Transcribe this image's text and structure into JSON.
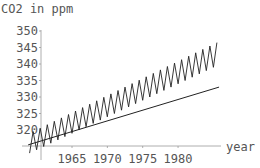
{
  "chart_data": {
    "type": "line",
    "title": "",
    "ylabel": "CO2 in ppm",
    "xlabel": "year",
    "xlim": [
      1958.8,
      1985.8
    ],
    "ylim": [
      314.5,
      350
    ],
    "x_ticks": [
      1965,
      1970,
      1975,
      1980
    ],
    "y_ticks": [
      320,
      325,
      330,
      335,
      340,
      345,
      350
    ],
    "grid": false,
    "legend": null,
    "series": [
      {
        "name": "Measured CO2 (seasonal oscillation)",
        "style": "zigzag",
        "start_year": 1959,
        "end_year": 1985.5,
        "trend_start": 316.0,
        "trend_end": 343.0,
        "amplitude_start": 3.0,
        "amplitude_end": 3.5,
        "period_years": 1
      },
      {
        "name": "Linear trend",
        "style": "line",
        "x": [
          1958.8,
          1985.8
        ],
        "y": [
          315.5,
          333.0
        ]
      }
    ]
  },
  "labels": {
    "ylabel": "CO2 in ppm",
    "xlabel": "year",
    "y_ticks": [
      "350",
      "345",
      "340",
      "335",
      "330",
      "325",
      "320"
    ],
    "x_ticks": [
      "1965",
      "1970",
      "1975",
      "1980"
    ]
  },
  "colors": {
    "axis": "#999999",
    "line": "#222222",
    "text": "#555555"
  }
}
